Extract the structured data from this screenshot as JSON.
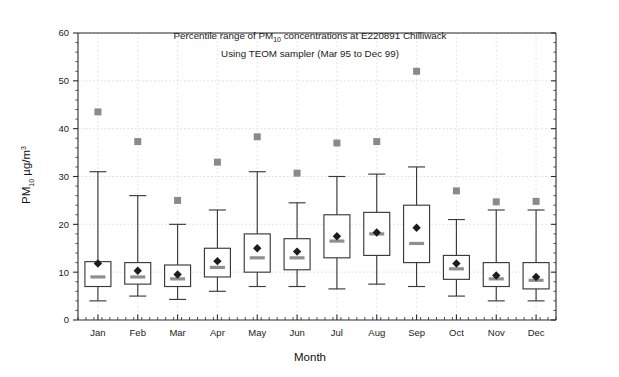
{
  "chart_data": {
    "type": "box",
    "title_line1_prefix": "Percentile range of PM",
    "title_line1_sub": "10",
    "title_line1_suffix": " concentrations at E220891 Chilliwack",
    "title_line2": "Using TEOM sampler (Mar 95 to Dec 99)",
    "xlabel": "Month",
    "ylabel_prefix": "PM",
    "ylabel_sub": "10",
    "ylabel_units": " µg/m",
    "ylabel_sup": "3",
    "ylim": [
      0,
      60
    ],
    "yticks": [
      0,
      10,
      20,
      30,
      40,
      50,
      60
    ],
    "ytick_labels": [
      "0",
      "10",
      "20",
      "30",
      "40",
      "50",
      "60"
    ],
    "grid": true,
    "legend": "none",
    "categories": [
      "Jan",
      "Feb",
      "Mar",
      "Apr",
      "May",
      "Jun",
      "Jul",
      "Aug",
      "Sep",
      "Oct",
      "Nov",
      "Dec"
    ],
    "series": [
      {
        "name": "Percentile range",
        "boxes": [
          {
            "category": "Jan",
            "whisker_low": 4.0,
            "q1": 7.0,
            "median": 9.0,
            "mean": 11.8,
            "q3": 12.2,
            "whisker_high": 31.0,
            "max": 43.5
          },
          {
            "category": "Feb",
            "whisker_low": 5.0,
            "q1": 7.5,
            "median": 9.0,
            "mean": 10.3,
            "q3": 12.0,
            "whisker_high": 26.0,
            "max": 37.3
          },
          {
            "category": "Mar",
            "whisker_low": 4.3,
            "q1": 7.0,
            "median": 8.6,
            "mean": 9.5,
            "q3": 11.5,
            "whisker_high": 20.0,
            "max": 25.0
          },
          {
            "category": "Apr",
            "whisker_low": 6.0,
            "q1": 9.0,
            "median": 11.0,
            "mean": 12.3,
            "q3": 15.0,
            "whisker_high": 23.0,
            "max": 33.0
          },
          {
            "category": "May",
            "whisker_low": 7.0,
            "q1": 10.0,
            "median": 13.0,
            "mean": 15.0,
            "q3": 18.0,
            "whisker_high": 31.0,
            "max": 38.3
          },
          {
            "category": "Jun",
            "whisker_low": 7.0,
            "q1": 10.5,
            "median": 13.0,
            "mean": 14.3,
            "q3": 17.0,
            "whisker_high": 24.5,
            "max": 30.7
          },
          {
            "category": "Jul",
            "whisker_low": 6.5,
            "q1": 13.0,
            "median": 16.5,
            "mean": 17.5,
            "q3": 22.0,
            "whisker_high": 30.0,
            "max": 37.0
          },
          {
            "category": "Aug",
            "whisker_low": 7.5,
            "q1": 13.5,
            "median": 18.0,
            "mean": 18.3,
            "q3": 22.5,
            "whisker_high": 30.5,
            "max": 37.3
          },
          {
            "category": "Sep",
            "whisker_low": 7.0,
            "q1": 12.0,
            "median": 16.0,
            "mean": 19.3,
            "q3": 24.0,
            "whisker_high": 32.0,
            "max": 52.0
          },
          {
            "category": "Oct",
            "whisker_low": 5.0,
            "q1": 8.5,
            "median": 10.7,
            "mean": 11.8,
            "q3": 13.5,
            "whisker_high": 21.0,
            "max": 27.0
          },
          {
            "category": "Nov",
            "whisker_low": 4.0,
            "q1": 7.0,
            "median": 8.6,
            "mean": 9.3,
            "q3": 12.0,
            "whisker_high": 23.0,
            "max": 24.7
          },
          {
            "category": "Dec",
            "whisker_low": 4.0,
            "q1": 6.5,
            "median": 8.3,
            "mean": 9.0,
            "q3": 12.0,
            "whisker_high": 23.0,
            "max": 24.8
          }
        ]
      }
    ],
    "colors": {
      "box_stroke": "#3a3a3a",
      "median": "#8f8f8f",
      "mean_marker": "#1c1c1c",
      "max_marker": "#8a8a8a",
      "grid": "#cfcfcf",
      "axis": "#2b2b2b",
      "background": "#ffffff"
    }
  }
}
